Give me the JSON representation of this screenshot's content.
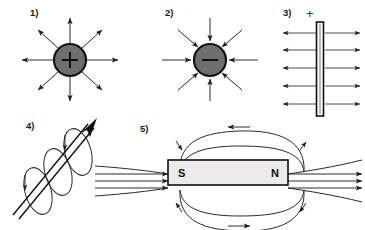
{
  "figure": {
    "background_color": "#ffffff",
    "width": 365,
    "height": 230,
    "line_color": "#2b2b2b",
    "sphere_fill": "#6e6e6e",
    "magnet_fill": "#eceaea"
  },
  "panels": {
    "p1": {
      "label": "1)",
      "charge_sign": "+",
      "field_direction": "outward",
      "ray_count": 8,
      "description": "positive point charge with radial field lines pointing outward"
    },
    "p2": {
      "label": "2)",
      "charge_sign": "−",
      "field_direction": "inward",
      "ray_count": 8,
      "description": "negative point charge with radial field lines pointing inward"
    },
    "p3": {
      "label": "3)",
      "plate_sign": "+",
      "field_direction": "outward-both-sides",
      "line_count": 5,
      "description": "positively charged flat plate with uniform horizontal field lines leaving both faces"
    },
    "p4": {
      "label": "4)",
      "field_direction": "circular",
      "loop_count": 3,
      "description": "current carrying wire with circular magnetic field loops around it"
    },
    "p5": {
      "label": "5)",
      "pole_left": "S",
      "pole_right": "N",
      "field_direction": "N-to-S",
      "description": "bar magnet with closed magnetic field loops running from north pole to south pole"
    }
  }
}
